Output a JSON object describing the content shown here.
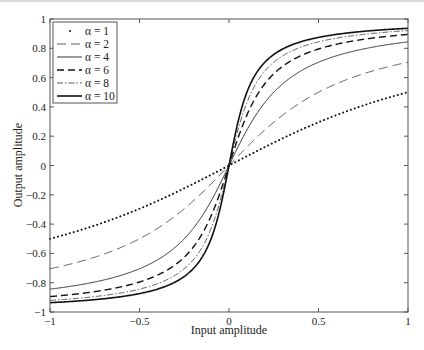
{
  "chart_data": {
    "type": "line",
    "title": "",
    "xlabel": "Input amplitude",
    "ylabel": "Output amplitude",
    "xlim": [
      -1,
      1
    ],
    "ylim": [
      -1,
      1
    ],
    "grid": false,
    "legend_position": "upper left",
    "x_ticks": [
      -1,
      -0.5,
      0,
      0.5,
      1
    ],
    "x_tick_labels": [
      "−1",
      "−0.5",
      "0",
      "0.5",
      "1"
    ],
    "y_ticks": [
      -1,
      -0.8,
      -0.6,
      -0.4,
      -0.2,
      0,
      0.2,
      0.4,
      0.6,
      0.8,
      1
    ],
    "y_tick_labels": [
      "−1",
      "−0.8",
      "−0.6",
      "−0.4",
      "−0.2",
      "0",
      "0.2",
      "0.4",
      "0.6",
      "0.8",
      "1"
    ],
    "x": [
      -1,
      -0.9,
      -0.8,
      -0.7,
      -0.6,
      -0.5,
      -0.4,
      -0.3,
      -0.2,
      -0.1,
      0,
      0.1,
      0.2,
      0.3,
      0.4,
      0.5,
      0.6,
      0.7,
      0.8,
      0.9,
      1
    ],
    "series": [
      {
        "name": "α = 1",
        "alpha": 1,
        "style": "dotted",
        "values": [
          -0.5,
          -0.466,
          -0.43,
          -0.389,
          -0.344,
          -0.295,
          -0.242,
          -0.185,
          -0.126,
          -0.064,
          0,
          0.064,
          0.126,
          0.185,
          0.242,
          0.295,
          0.344,
          0.389,
          0.43,
          0.466,
          0.5
        ]
      },
      {
        "name": "α = 2",
        "alpha": 2,
        "style": "long-dash",
        "values": [
          -0.705,
          -0.681,
          -0.653,
          -0.62,
          -0.58,
          -0.5,
          -0.43,
          -0.344,
          -0.242,
          -0.126,
          0,
          0.126,
          0.242,
          0.344,
          0.43,
          0.5,
          0.58,
          0.62,
          0.653,
          0.681,
          0.705
        ]
      },
      {
        "name": "α = 4",
        "alpha": 4,
        "style": "solid-thin",
        "values": [
          -0.844,
          -0.829,
          -0.81,
          -0.787,
          -0.758,
          -0.705,
          -0.653,
          -0.58,
          -0.43,
          -0.242,
          0,
          0.242,
          0.43,
          0.58,
          0.653,
          0.705,
          0.758,
          0.787,
          0.81,
          0.829,
          0.844
        ]
      },
      {
        "name": "α = 6",
        "alpha": 6,
        "style": "dashed-thick",
        "values": [
          -0.895,
          -0.883,
          -0.869,
          -0.851,
          -0.829,
          -0.795,
          -0.748,
          -0.676,
          -0.546,
          -0.344,
          0,
          0.344,
          0.546,
          0.676,
          0.748,
          0.795,
          0.829,
          0.851,
          0.869,
          0.883,
          0.895
        ]
      },
      {
        "name": "α = 8",
        "alpha": 8,
        "style": "dash-dot",
        "values": [
          -0.921,
          -0.912,
          -0.901,
          -0.887,
          -0.869,
          -0.844,
          -0.805,
          -0.745,
          -0.62,
          -0.43,
          0,
          0.43,
          0.62,
          0.745,
          0.805,
          0.844,
          0.869,
          0.887,
          0.901,
          0.912,
          0.921
        ]
      },
      {
        "name": "α = 10",
        "alpha": 10,
        "style": "solid-thick",
        "values": [
          -0.937,
          -0.929,
          -0.92,
          -0.909,
          -0.895,
          -0.874,
          -0.844,
          -0.795,
          -0.705,
          -0.5,
          0,
          0.5,
          0.705,
          0.795,
          0.844,
          0.874,
          0.895,
          0.909,
          0.92,
          0.929,
          0.937
        ]
      }
    ],
    "function": "y = (2/π)·arctan(αx)"
  },
  "axes": {
    "xlabel": "Input amplitude",
    "ylabel": "Output amplitude"
  },
  "legend": {
    "items": [
      {
        "label": "α = 1"
      },
      {
        "label": "α = 2"
      },
      {
        "label": "α = 4"
      },
      {
        "label": "α = 6"
      },
      {
        "label": "α = 8"
      },
      {
        "label": "α = 10"
      }
    ]
  }
}
